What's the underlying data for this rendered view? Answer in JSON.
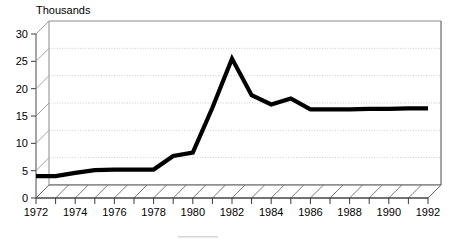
{
  "chart_data": {
    "type": "line",
    "title": "Thousands",
    "xlabel": "",
    "ylabel": "",
    "x": [
      1972,
      1973,
      1974,
      1975,
      1976,
      1977,
      1978,
      1979,
      1980,
      1981,
      1982,
      1983,
      1984,
      1985,
      1986,
      1987,
      1988,
      1989,
      1990,
      1991,
      1992
    ],
    "values": [
      4.0,
      4.0,
      4.6,
      5.1,
      5.2,
      5.2,
      5.2,
      7.7,
      8.3,
      16.5,
      25.5,
      18.8,
      17.1,
      18.2,
      16.2,
      16.2,
      16.2,
      16.3,
      16.3,
      16.4,
      16.4
    ],
    "series": [
      {
        "name": "Thousands",
        "values": [
          4.0,
          4.0,
          4.6,
          5.1,
          5.2,
          5.2,
          5.2,
          7.7,
          8.3,
          16.5,
          25.5,
          18.8,
          17.1,
          18.2,
          16.2,
          16.2,
          16.2,
          16.3,
          16.3,
          16.4,
          16.4
        ]
      }
    ],
    "x_tick_labels": [
      "1972",
      "1974",
      "1976",
      "1978",
      "1980",
      "1982",
      "1984",
      "1986",
      "1988",
      "1990",
      "1992"
    ],
    "x_tick_values": [
      1972,
      1974,
      1976,
      1978,
      1980,
      1982,
      1984,
      1986,
      1988,
      1990,
      1992
    ],
    "y_tick_labels": [
      "0",
      "5",
      "10",
      "15",
      "20",
      "25",
      "30"
    ],
    "y_tick_values": [
      0,
      5,
      10,
      15,
      20,
      25,
      30
    ],
    "ylim": [
      0,
      30
    ],
    "xlim": [
      1972,
      1992
    ],
    "grid": true,
    "legend": false,
    "style": "3d-perspective",
    "line_color": "#000000",
    "grid_color": "#bdbdbd",
    "frame_color": "#8a8a8a"
  },
  "axis": {
    "y_labels": [
      "30",
      "25",
      "20",
      "15",
      "10",
      "5",
      "0"
    ],
    "x_labels": [
      "1972",
      "1974",
      "1976",
      "1978",
      "1980",
      "1982",
      "1984",
      "1986",
      "1988",
      "1990",
      "1992"
    ]
  },
  "title": {
    "text": "Thousands"
  }
}
